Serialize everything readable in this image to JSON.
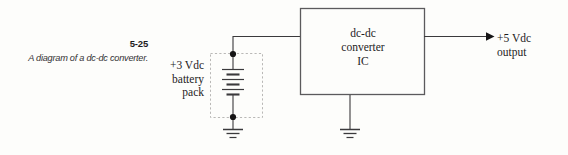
{
  "figure": {
    "number": "5-25",
    "caption": "A diagram of a dc-dc\nconverter.",
    "caption_line1": "A diagram of a dc-dc",
    "caption_line2": "converter."
  },
  "source": {
    "label_line1": "+3 Vdc",
    "label_line2": "battery",
    "label_line3": "pack",
    "voltage": "+3 Vdc",
    "type": "battery pack",
    "cells": 3
  },
  "ic": {
    "label_line1": "dc-dc",
    "label_line2": "converter",
    "label_line3": "IC",
    "name": "dc-dc converter IC"
  },
  "output": {
    "label_line1": "+5 Vdc",
    "label_line2": "output",
    "voltage": "+5 Vdc",
    "name": "output"
  },
  "icons": {
    "ground_source": "ground-symbol",
    "ground_ic": "ground-symbol",
    "arrow_output": "arrowhead-right-icon",
    "node_top": "junction-dot",
    "node_bottom": "junction-dot",
    "dashed_enclosure": "dashed-boundary-box"
  },
  "colors": {
    "background": "#fdfdfb",
    "wire": "#3b3a3c",
    "ic_border": "#5b5a5c",
    "dashed_border": "#b9b8b6",
    "text": "#1d1c1d",
    "node_fill": "#161516"
  }
}
